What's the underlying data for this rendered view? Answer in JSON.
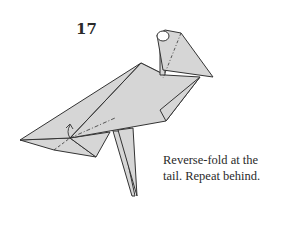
{
  "step": {
    "number": "17",
    "instruction_lines": [
      "Reverse-fold at the",
      "tail. Repeat behind."
    ]
  },
  "diagram": {
    "paper_color": "#d6d6d6",
    "line_color": "#333333",
    "background": "#ffffff",
    "symbols": [
      "valley-fold-line",
      "mountain-fold-line",
      "reverse-fold-arrow"
    ]
  }
}
